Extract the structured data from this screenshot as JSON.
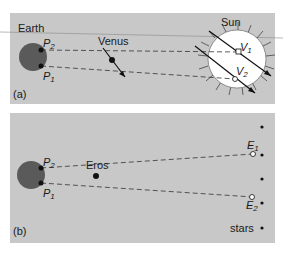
{
  "panel_a": {
    "tag": "(a)",
    "earth_label": "Earth",
    "venus_label": "Venus",
    "sun_label": "Sun",
    "p2": {
      "letter": "P",
      "sub": "2"
    },
    "p1": {
      "letter": "P",
      "sub": "1"
    },
    "v1": {
      "letter": "V",
      "sub": "1"
    },
    "v2": {
      "letter": "V",
      "sub": "2"
    }
  },
  "panel_b": {
    "tag": "(b)",
    "eros_label": "Eros",
    "stars_label": "stars",
    "p2": {
      "letter": "P",
      "sub": "2"
    },
    "p1": {
      "letter": "P",
      "sub": "1"
    },
    "e1": {
      "letter": "E",
      "sub": "1"
    },
    "e2": {
      "letter": "E",
      "sub": "2"
    }
  },
  "colors": {
    "panel_bg": "#c8c8c8",
    "earth": "#5a5a5a",
    "sun": "#ffffff",
    "line": "#333333"
  }
}
